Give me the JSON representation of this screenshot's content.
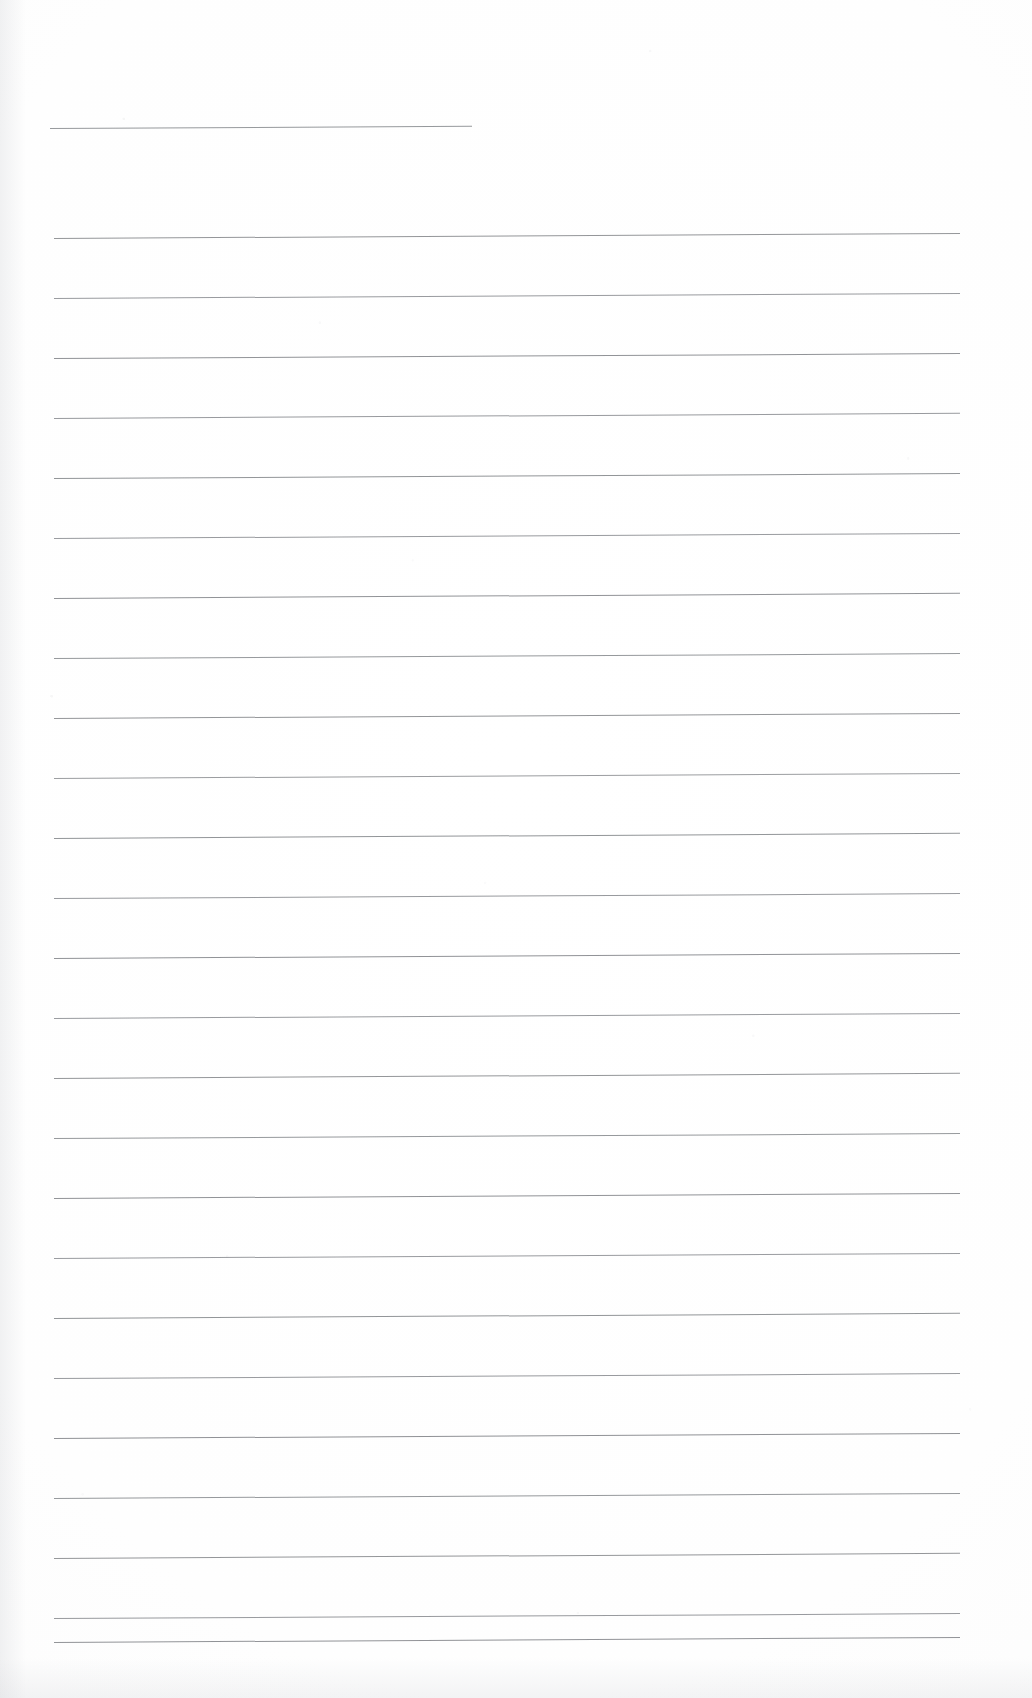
{
  "document": {
    "kind": "scanned-page",
    "title": "Blank lined notepad page (scan)",
    "page_width": 1032,
    "page_height": 1698,
    "paper_color": "#fdfdfd",
    "ink_color": "#6e7176",
    "text_content": "",
    "visible_text_blocks": [],
    "orientation": "portrait",
    "scan_skew_degrees": -0.32
  },
  "ruling": {
    "line_count": 26,
    "line_spacing_px": 60,
    "first_line_y": 128,
    "last_line_y": 1638,
    "left_margin_x": 53,
    "right_margin_x": 960,
    "line_thickness_px": 1,
    "has_vertical_margin_rule": false,
    "has_holes": false,
    "lines": [
      {
        "index": 1,
        "y": 128,
        "x_start": 50,
        "x_end": 472,
        "opacity": 0.72,
        "skew": -0.3
      },
      {
        "index": 2,
        "y": 238,
        "x_start": 54,
        "x_end": 960,
        "opacity": 0.74,
        "skew": -0.32
      },
      {
        "index": 3,
        "y": 298,
        "x_start": 54,
        "x_end": 960,
        "opacity": 0.7,
        "skew": -0.32
      },
      {
        "index": 4,
        "y": 358,
        "x_start": 54,
        "x_end": 960,
        "opacity": 0.76,
        "skew": -0.31
      },
      {
        "index": 5,
        "y": 418,
        "x_start": 54,
        "x_end": 960,
        "opacity": 0.71,
        "skew": -0.33
      },
      {
        "index": 6,
        "y": 478,
        "x_start": 54,
        "x_end": 960,
        "opacity": 0.75,
        "skew": -0.31
      },
      {
        "index": 7,
        "y": 538,
        "x_start": 54,
        "x_end": 960,
        "opacity": 0.7,
        "skew": -0.32
      },
      {
        "index": 8,
        "y": 598,
        "x_start": 54,
        "x_end": 960,
        "opacity": 0.76,
        "skew": -0.33
      },
      {
        "index": 9,
        "y": 658,
        "x_start": 54,
        "x_end": 960,
        "opacity": 0.72,
        "skew": -0.31
      },
      {
        "index": 10,
        "y": 718,
        "x_start": 54,
        "x_end": 960,
        "opacity": 0.74,
        "skew": -0.32
      },
      {
        "index": 11,
        "y": 778,
        "x_start": 54,
        "x_end": 960,
        "opacity": 0.69,
        "skew": -0.32
      },
      {
        "index": 12,
        "y": 838,
        "x_start": 54,
        "x_end": 960,
        "opacity": 0.75,
        "skew": -0.33
      },
      {
        "index": 13,
        "y": 898,
        "x_start": 54,
        "x_end": 960,
        "opacity": 0.71,
        "skew": -0.31
      },
      {
        "index": 14,
        "y": 958,
        "x_start": 54,
        "x_end": 960,
        "opacity": 0.76,
        "skew": -0.32
      },
      {
        "index": 15,
        "y": 1018,
        "x_start": 54,
        "x_end": 960,
        "opacity": 0.7,
        "skew": -0.32
      },
      {
        "index": 16,
        "y": 1078,
        "x_start": 54,
        "x_end": 960,
        "opacity": 0.74,
        "skew": -0.33
      },
      {
        "index": 17,
        "y": 1138,
        "x_start": 54,
        "x_end": 960,
        "opacity": 0.72,
        "skew": -0.31
      },
      {
        "index": 18,
        "y": 1198,
        "x_start": 54,
        "x_end": 960,
        "opacity": 0.76,
        "skew": -0.32
      },
      {
        "index": 19,
        "y": 1258,
        "x_start": 54,
        "x_end": 960,
        "opacity": 0.7,
        "skew": -0.32
      },
      {
        "index": 20,
        "y": 1318,
        "x_start": 54,
        "x_end": 960,
        "opacity": 0.75,
        "skew": -0.33
      },
      {
        "index": 21,
        "y": 1378,
        "x_start": 54,
        "x_end": 960,
        "opacity": 0.71,
        "skew": -0.31
      },
      {
        "index": 22,
        "y": 1438,
        "x_start": 54,
        "x_end": 960,
        "opacity": 0.77,
        "skew": -0.32
      },
      {
        "index": 23,
        "y": 1498,
        "x_start": 54,
        "x_end": 960,
        "opacity": 0.72,
        "skew": -0.32
      },
      {
        "index": 24,
        "y": 1558,
        "x_start": 54,
        "x_end": 960,
        "opacity": 0.74,
        "skew": -0.33
      },
      {
        "index": 25,
        "y": 1618,
        "x_start": 54,
        "x_end": 960,
        "opacity": 0.71,
        "skew": -0.31
      },
      {
        "index": 26,
        "y": 1642,
        "x_start": 54,
        "x_end": 960,
        "opacity": 0.76,
        "skew": -0.32
      }
    ]
  }
}
